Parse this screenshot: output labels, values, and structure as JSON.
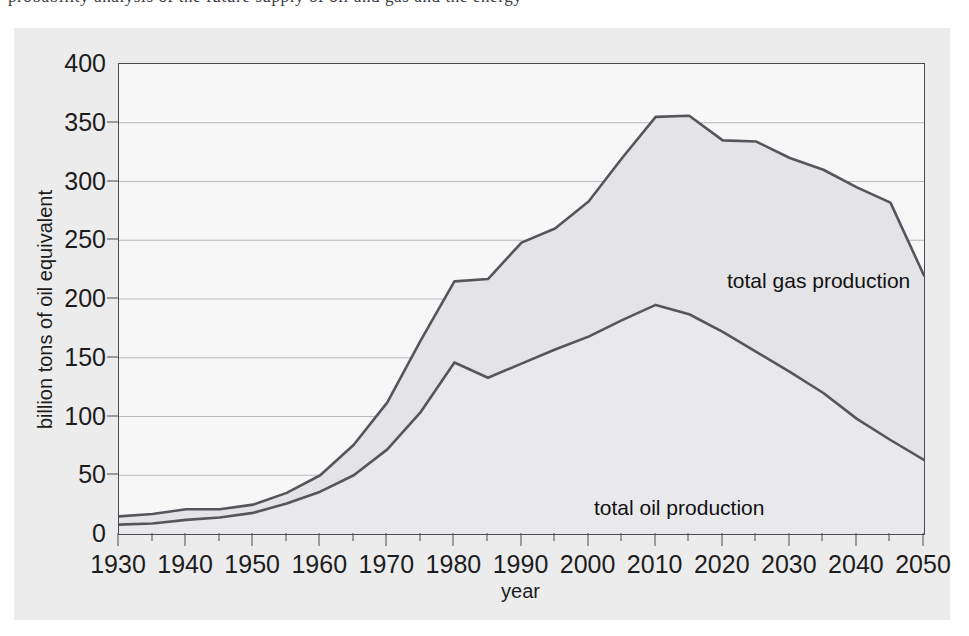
{
  "page": {
    "background_color": "#ffffff",
    "panel_color": "#ececed",
    "plot_background_color": "#f7f7f8",
    "axis_color": "#4a4a50",
    "line_color": "#55555c",
    "fill_color": "#e4e4e6",
    "top_text_sliver": "probability analysis of the future supply of oil and gas and the energy"
  },
  "chart_data": {
    "type": "area",
    "title": "",
    "subtitle": "",
    "xlabel": "year",
    "ylabel": "billion tons of oil equivalent",
    "xlim": [
      1930,
      2050
    ],
    "ylim": [
      0,
      400
    ],
    "grid": true,
    "grid_axis": "y",
    "legend_position": "inline-annotation",
    "x_major_ticks": [
      1930,
      1940,
      1950,
      1960,
      1970,
      1980,
      1990,
      2000,
      2010,
      2020,
      2030,
      2040,
      2050
    ],
    "x_minor_ticks": [
      1935,
      1945,
      1955,
      1965,
      1975,
      1985,
      1995,
      2005,
      2015,
      2025,
      2035,
      2045
    ],
    "y_ticks": [
      0,
      50,
      100,
      150,
      200,
      250,
      300,
      350,
      400
    ],
    "x_tick_labels": [
      "1930",
      "1940",
      "1950",
      "1960",
      "1970",
      "1980",
      "1990",
      "2000",
      "2010",
      "2020",
      "2030",
      "2040",
      "2050"
    ],
    "y_tick_labels": [
      "0",
      "50",
      "100",
      "150",
      "200",
      "250",
      "300",
      "350",
      "400"
    ],
    "x": [
      1930,
      1935,
      1940,
      1945,
      1950,
      1955,
      1960,
      1965,
      1970,
      1975,
      1980,
      1985,
      1990,
      1995,
      2000,
      2005,
      2010,
      2015,
      2020,
      2025,
      2030,
      2035,
      2040,
      2045,
      2050
    ],
    "series": [
      {
        "name": "total gas production",
        "annotation": "total gas production",
        "stacking": "cumulative-total",
        "values": [
          15,
          17,
          21,
          21,
          25,
          35,
          50,
          76,
          112,
          165,
          215,
          217,
          248,
          260,
          283,
          320,
          355,
          356,
          335,
          334,
          320,
          310,
          295,
          282,
          220
        ]
      },
      {
        "name": "total oil production",
        "annotation": "total oil production",
        "stacking": "lower-band",
        "values": [
          8,
          9,
          12,
          14,
          18,
          26,
          36,
          50,
          72,
          104,
          146,
          133,
          145,
          157,
          168,
          182,
          195,
          187,
          172,
          155,
          138,
          120,
          98,
          80,
          63
        ]
      }
    ],
    "annotations": [
      {
        "text": "total gas production",
        "x": 2002,
        "y": 270
      },
      {
        "text": "total oil production",
        "x": 1985,
        "y": 78
      }
    ]
  }
}
